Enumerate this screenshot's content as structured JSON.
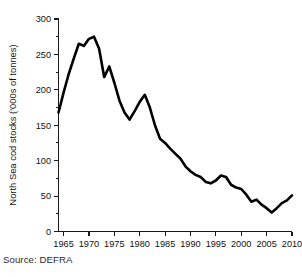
{
  "figure": {
    "source_caption": "Source: DEFRA"
  },
  "chart_data": {
    "type": "line",
    "title": "",
    "subtitle": "",
    "xlabel": "",
    "ylabel": "North Sea cod stocks ('000s of tonnes)",
    "xlim": [
      1964,
      2010
    ],
    "ylim": [
      0,
      300
    ],
    "grid": false,
    "legend": false,
    "legend_position": "none",
    "x_ticks": [
      1965,
      1970,
      1975,
      1980,
      1985,
      1990,
      1995,
      2000,
      2005,
      2010
    ],
    "x_tick_labels": [
      "1965",
      "1970",
      "1975",
      "1980",
      "1985",
      "1990",
      "1995",
      "2000",
      "2005",
      "2010"
    ],
    "x_minor_tick_interval": 1,
    "y_ticks": [
      0,
      50,
      100,
      150,
      200,
      250,
      300
    ],
    "y_tick_labels": [
      "0",
      "50",
      "100",
      "150",
      "200",
      "250",
      "300"
    ],
    "y_minor_tick_interval": 25,
    "line_color": "#000000",
    "series": [
      {
        "name": "North Sea cod stocks",
        "x": [
          1964,
          1965,
          1966,
          1967,
          1968,
          1969,
          1970,
          1971,
          1972,
          1973,
          1974,
          1975,
          1976,
          1977,
          1978,
          1979,
          1980,
          1981,
          1982,
          1983,
          1984,
          1985,
          1986,
          1987,
          1988,
          1989,
          1990,
          1991,
          1992,
          1993,
          1994,
          1995,
          1996,
          1997,
          1998,
          1999,
          2000,
          2001,
          2002,
          2003,
          2004,
          2005,
          2006,
          2007,
          2008,
          2009,
          2010
        ],
        "values": [
          168,
          196,
          222,
          244,
          265,
          262,
          272,
          275,
          258,
          218,
          233,
          210,
          185,
          168,
          158,
          170,
          183,
          193,
          175,
          150,
          131,
          125,
          117,
          110,
          103,
          92,
          85,
          80,
          77,
          70,
          68,
          72,
          79,
          77,
          66,
          62,
          60,
          52,
          42,
          45,
          38,
          33,
          27,
          33,
          40,
          44,
          51
        ]
      }
    ]
  }
}
